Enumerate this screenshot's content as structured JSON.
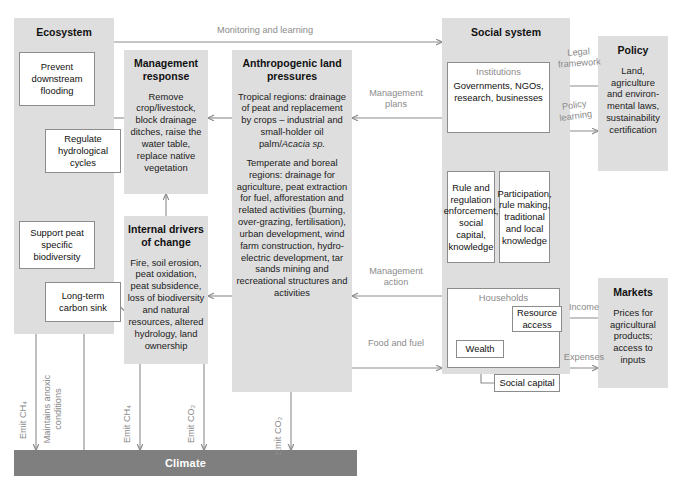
{
  "diagram": {
    "colors": {
      "panel_bg": "#dedede",
      "box_bg": "#ffffff",
      "box_border": "#8c8c8c",
      "arrow": "#8b8b8b",
      "climate_bar": "#7f7f7f",
      "text": "#1a1a1a",
      "muted_text": "#8b8b8b"
    }
  },
  "panels": {
    "ecosystem": {
      "title": "Ecosystem"
    },
    "management_response": {
      "title": "Management response",
      "body": "Remove crop/livestock, block drainage ditches, raise the water table, replace native vegetation"
    },
    "internal_drivers": {
      "title": "Internal drivers of change",
      "body": "Fire, soil erosion, peat oxidation, peat subsidence, loss of biodiversity and natural resources, altered hydrology, land ownership"
    },
    "anthropogenic": {
      "title": "Anthropogenic land pressures",
      "para1_pre": "Tropical regions: drainage of peat and replacement by crops – industrial and small-holder oil palm/",
      "para1_italic": "Acacia sp.",
      "para2": "Temperate and boreal regions: drainage for agriculture, peat extraction for fuel, afforestation and related activities (burning, over-grazing, fertilisation), urban development, wind farm construction, hydro-electric development, tar sands mining and recreational structures and activities"
    },
    "social_system": {
      "title": "Social system"
    },
    "policy": {
      "title": "Policy",
      "body": "Land, agriculture and environ-mental laws, sustainability certification"
    },
    "markets": {
      "title": "Markets",
      "body": "Prices for agricultural products; access to inputs"
    }
  },
  "boxes": {
    "prevent_flooding": "Prevent downstream flooding",
    "regulate_hydrological": "Regulate hydrological cycles",
    "support_biodiversity": "Support peat specific biodiversity",
    "carbon_sink": "Long-term carbon sink",
    "institutions_label": "Institutions",
    "institutions_body": "Governments, NGOs, research, businesses",
    "rule_regulation": "Rule and regulation enforcement, social capital, knowledge",
    "participation": "Participation, rule making, traditional and local knowledge",
    "households_label": "Households",
    "resource_access": "Resource access",
    "wealth": "Wealth",
    "social_capital": "Social capital"
  },
  "climate": {
    "label": "Climate"
  },
  "edge_labels": {
    "monitoring": "Monitoring and learning",
    "management_plans": "Management plans",
    "management_action": "Management action",
    "food_and_fuel": "Food and fuel",
    "legal_framework": "Legal framework",
    "policy_learning": "Policy learning",
    "income": "Income",
    "expenses": "Expenses"
  },
  "vertical_labels": {
    "emit_ch4_eco": "Emit CH₄",
    "maintains_anoxic": "Maintains anoxic conditions",
    "emit_ch4_drivers": "Emit CH₄",
    "emit_co2_drivers": "Emit CO₂",
    "emit_co2_anthro": "Emit CO₂"
  }
}
